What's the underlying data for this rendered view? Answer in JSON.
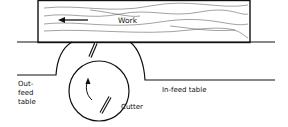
{
  "diagram": {
    "labels": {
      "work": "Work",
      "outfeed_line1": "Out-",
      "outfeed_line2": "feed",
      "outfeed_line3": "table",
      "infeed": "In-feed table",
      "cutter": "Cutter"
    },
    "stroke_color": "#111111",
    "background": "#ffffff"
  }
}
